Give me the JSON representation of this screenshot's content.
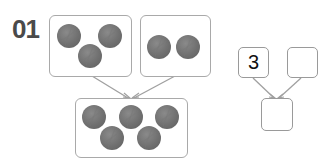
{
  "problem": {
    "number": "01"
  },
  "picture_diagram": {
    "left_group": {
      "count": 3
    },
    "right_group": {
      "count": 2
    },
    "total_group": {
      "count": 5
    }
  },
  "number_bond": {
    "left_part": "3",
    "right_part": "",
    "whole": ""
  },
  "colors": {
    "ball": "#6e6e6e",
    "box_border": "#a9a9a9",
    "arrow": "#a0a0a0",
    "number_text": "#4a4a4a"
  }
}
